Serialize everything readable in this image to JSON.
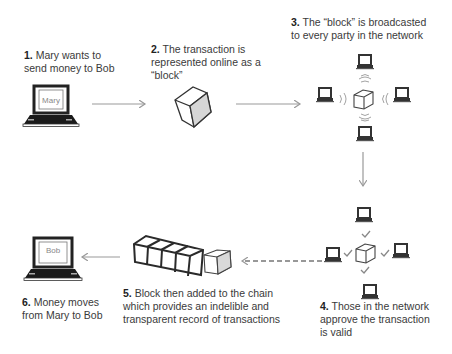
{
  "steps": [
    {
      "num": "1.",
      "text": "Mary wants to send money to Bob",
      "lines": [
        "Mary wants to",
        "send money to Bob"
      ]
    },
    {
      "num": "2.",
      "text": "The transaction is represented online as a “block”",
      "lines": [
        "The transaction is",
        "represented online as a",
        "“block”"
      ]
    },
    {
      "num": "3.",
      "text": "The “block” is broadcasted to every party in the network",
      "lines": [
        "The “block” is broadcasted",
        "to every party in the network"
      ]
    },
    {
      "num": "4.",
      "text": "Those in the network approve the transaction is valid",
      "lines": [
        "Those in the network",
        "approve the transaction",
        "is valid"
      ]
    },
    {
      "num": "5.",
      "text": "Block then added to the chain which provides an indelible and transparent record of transactions",
      "lines": [
        "Block then added to the chain",
        "which provides an indelible and",
        "transparent record of transactions"
      ]
    },
    {
      "num": "6.",
      "text": "Money moves from Mary to Bob",
      "lines": [
        "Money moves",
        "from Mary to Bob"
      ]
    }
  ],
  "laptops": {
    "sender_label": "Mary",
    "receiver_label": "Bob"
  },
  "icons": [
    "laptop-icon",
    "block-cube-icon",
    "signal-waves-icon",
    "checkmark-icon",
    "blockchain-icon",
    "arrow-icon",
    "dashed-arrow-icon"
  ],
  "colors": {
    "line": "#333333",
    "arrow": "#999999",
    "screen_text": "#888888",
    "cube_shade": "#cccccc"
  }
}
